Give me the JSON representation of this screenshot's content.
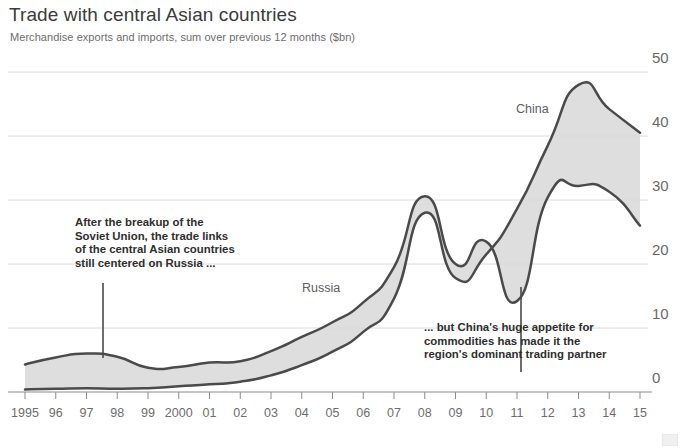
{
  "header": {
    "title": "Trade with central Asian countries",
    "subtitle": "Merchandise exports and imports, sum over previous 12 months ($bn)"
  },
  "annotations": [
    {
      "name": "annotation-russia",
      "lines": [
        "After the breakup of the",
        "Soviet Union, the trade links",
        "of the central Asian countries",
        "still centered on Russia ..."
      ]
    },
    {
      "name": "annotation-china",
      "lines": [
        "... but China's huge appetite for",
        "commodities has made it the",
        "region's dominant trading partner"
      ]
    }
  ],
  "series_labels": {
    "russia": "Russia",
    "china": "China"
  },
  "colors": {
    "line": "#4a4a4a",
    "fill": "#d8d8d8",
    "grid": "#d9d9d9",
    "text": "#3a3a3a",
    "axis_text": "#6d6d6d"
  },
  "chart_data": {
    "type": "line",
    "title": "Trade with central Asian countries",
    "subtitle": "Merchandise exports and imports, sum over previous 12 months ($bn)",
    "xlabel": "",
    "ylabel": "$bn",
    "ylim": [
      0,
      50
    ],
    "yticks": [
      0,
      10,
      20,
      30,
      40,
      50
    ],
    "grid": true,
    "legend": "inline-labels",
    "x": [
      1995,
      1996,
      1997,
      1998,
      1999,
      2000,
      2001,
      2002,
      2003,
      2004,
      2005,
      2006,
      2007,
      2008,
      2009,
      2010,
      2011,
      2012,
      2013,
      2014,
      2015
    ],
    "xtick_labels": [
      "1995",
      "96",
      "97",
      "98",
      "99",
      "2000",
      "01",
      "02",
      "03",
      "04",
      "05",
      "06",
      "07",
      "08",
      "09",
      "10",
      "11",
      "12",
      "13",
      "14",
      "15"
    ],
    "series": [
      {
        "name": "Russia",
        "values": [
          4.3,
          5.4,
          6.0,
          5.5,
          3.8,
          3.9,
          4.6,
          4.8,
          6.4,
          8.6,
          10.9,
          14.0,
          19.5,
          30.6,
          20.0,
          23.5,
          14.2,
          30.4,
          32.2,
          31.3,
          26.0
        ]
      },
      {
        "name": "China",
        "values": [
          0.4,
          0.5,
          0.6,
          0.5,
          0.6,
          0.9,
          1.2,
          1.6,
          2.6,
          4.2,
          6.3,
          9.4,
          14.6,
          28.0,
          17.8,
          21.5,
          28.6,
          38.5,
          48.0,
          44.2,
          40.5
        ]
      }
    ],
    "annotation_markers": [
      {
        "series": "Russia",
        "x": 1997.7,
        "note": "After the breakup of the Soviet Union, the trade links of the central Asian countries still centered on Russia ..."
      },
      {
        "series": "Russia",
        "x": 2011.3,
        "note": "... but China's huge appetite for commodities has made it the region's dominant trading partner"
      }
    ]
  }
}
